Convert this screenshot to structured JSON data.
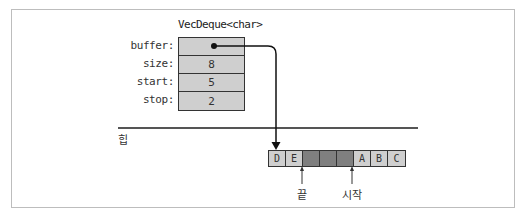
{
  "diagram": {
    "struct": {
      "type_label": "VecDeque<char>",
      "fields": [
        {
          "label": "buffer:",
          "value": "●",
          "kind": "pointer"
        },
        {
          "label": "size:",
          "value": "8"
        },
        {
          "label": "start:",
          "value": "5"
        },
        {
          "label": "stop:",
          "value": "2"
        }
      ]
    },
    "heap_label": "힙",
    "buffer_cells": [
      {
        "value": "D",
        "state": "filled"
      },
      {
        "value": "E",
        "state": "filled"
      },
      {
        "value": "",
        "state": "empty"
      },
      {
        "value": "",
        "state": "empty"
      },
      {
        "value": "",
        "state": "empty"
      },
      {
        "value": "A",
        "state": "filled"
      },
      {
        "value": "B",
        "state": "filled"
      },
      {
        "value": "C",
        "state": "filled"
      }
    ],
    "markers": {
      "end_label": "끝",
      "start_label": "시작"
    },
    "colors": {
      "filled_cell": "#cfcfcf",
      "empty_cell": "#7f7f7f",
      "border": "#333333",
      "frame": "#bdbdbd"
    }
  }
}
